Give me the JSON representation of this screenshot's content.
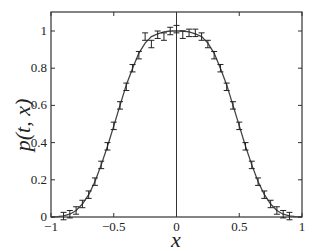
{
  "chart_data": {
    "type": "line",
    "title": "",
    "xlabel": "x",
    "ylabel": "p(t, x)",
    "xlim": [
      -1,
      1
    ],
    "ylim": [
      0,
      1.1
    ],
    "xticks": [
      "-1",
      "-0.5",
      "0",
      "0.5",
      "1"
    ],
    "yticks": [
      "0",
      "0.2",
      "0.4",
      "0.6",
      "0.8",
      "1"
    ],
    "grid": false,
    "legend": null,
    "series": [
      {
        "name": "analytic curve",
        "style": "solid line",
        "x": [
          -1,
          -0.95,
          -0.9,
          -0.85,
          -0.8,
          -0.75,
          -0.7,
          -0.65,
          -0.6,
          -0.55,
          -0.5,
          -0.45,
          -0.4,
          -0.35,
          -0.3,
          -0.25,
          -0.2,
          -0.15,
          -0.1,
          -0.05,
          0,
          0.05,
          0.1,
          0.15,
          0.2,
          0.25,
          0.3,
          0.35,
          0.4,
          0.45,
          0.5,
          0.55,
          0.6,
          0.65,
          0.7,
          0.75,
          0.8,
          0.85,
          0.9,
          0.95,
          1
        ],
        "values": [
          0,
          0.002,
          0.006,
          0.015,
          0.035,
          0.07,
          0.12,
          0.19,
          0.28,
          0.38,
          0.49,
          0.6,
          0.71,
          0.8,
          0.88,
          0.935,
          0.97,
          0.985,
          0.995,
          1,
          1,
          1,
          0.995,
          0.985,
          0.97,
          0.935,
          0.88,
          0.8,
          0.71,
          0.6,
          0.49,
          0.38,
          0.28,
          0.19,
          0.12,
          0.07,
          0.035,
          0.015,
          0.006,
          0.002,
          0
        ]
      },
      {
        "name": "simulation with error bars",
        "style": "error bars",
        "x": [
          -0.9,
          -0.85,
          -0.8,
          -0.75,
          -0.7,
          -0.65,
          -0.6,
          -0.55,
          -0.5,
          -0.45,
          -0.4,
          -0.35,
          -0.3,
          -0.25,
          -0.2,
          -0.15,
          -0.1,
          -0.05,
          0,
          0.05,
          0.1,
          0.15,
          0.2,
          0.25,
          0.3,
          0.35,
          0.4,
          0.45,
          0.5,
          0.55,
          0.6,
          0.65,
          0.7,
          0.75,
          0.8,
          0.85,
          0.9
        ],
        "values": [
          0.005,
          0.015,
          0.035,
          0.07,
          0.12,
          0.19,
          0.28,
          0.38,
          0.49,
          0.6,
          0.7,
          0.8,
          0.87,
          0.97,
          0.93,
          0.98,
          0.97,
          1.0,
          1.01,
          0.98,
          0.99,
          0.99,
          0.97,
          0.93,
          0.87,
          0.8,
          0.7,
          0.6,
          0.49,
          0.38,
          0.28,
          0.19,
          0.12,
          0.07,
          0.035,
          0.015,
          0.005
        ],
        "error": 0.02
      }
    ]
  }
}
